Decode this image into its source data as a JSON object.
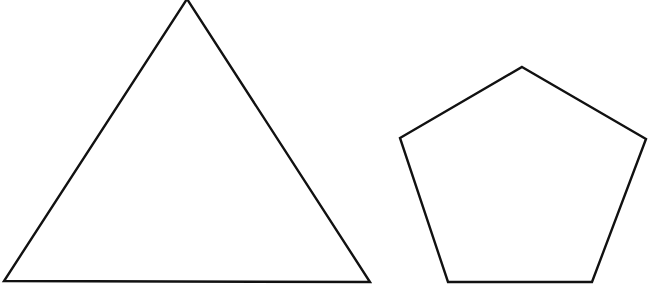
{
  "diagram": {
    "background": "#ffffff",
    "stroke_color": "#111111",
    "stroke_width": 2.4,
    "shapes": [
      {
        "name": "triangle",
        "sides": 3,
        "points": "187,-1 4,281 370,282"
      },
      {
        "name": "pentagon",
        "sides": 5,
        "points": "522,67 646,139 592,282 448,282 400,138"
      }
    ]
  }
}
